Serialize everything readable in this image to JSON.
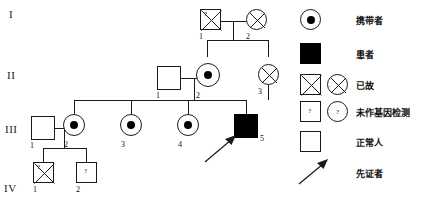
{
  "generations": [
    {
      "label": "I"
    },
    {
      "label": "II"
    },
    {
      "label": "III"
    },
    {
      "label": "IV"
    }
  ],
  "individuals": [
    {
      "id": "I-1",
      "number": "1",
      "sex": "male",
      "status": "untested-deceased",
      "generation": "I"
    },
    {
      "id": "I-2",
      "number": "2",
      "sex": "female",
      "status": "deceased",
      "generation": "I"
    },
    {
      "id": "II-1",
      "number": "1",
      "sex": "male",
      "status": "normal",
      "generation": "II"
    },
    {
      "id": "II-2",
      "number": "2",
      "sex": "female",
      "status": "carrier",
      "generation": "II"
    },
    {
      "id": "II-3",
      "number": "3",
      "sex": "female",
      "status": "deceased",
      "generation": "II"
    },
    {
      "id": "III-1",
      "number": "1",
      "sex": "male",
      "status": "normal",
      "generation": "III"
    },
    {
      "id": "III-2",
      "number": "2",
      "sex": "female",
      "status": "carrier",
      "generation": "III"
    },
    {
      "id": "III-3",
      "number": "3",
      "sex": "female",
      "status": "carrier",
      "generation": "III"
    },
    {
      "id": "III-4",
      "number": "4",
      "sex": "female",
      "status": "carrier",
      "generation": "III"
    },
    {
      "id": "III-5",
      "number": "5",
      "sex": "male",
      "status": "affected-proband",
      "generation": "III"
    },
    {
      "id": "IV-1",
      "number": "1",
      "sex": "male",
      "status": "untested-deceased",
      "generation": "IV"
    },
    {
      "id": "IV-2",
      "number": "2",
      "sex": "male",
      "status": "untested",
      "generation": "IV"
    }
  ],
  "question_mark": "?",
  "legend": {
    "items": [
      {
        "key": "carrier",
        "label": "携带者"
      },
      {
        "key": "affected",
        "label": "患者"
      },
      {
        "key": "deceased",
        "label": "已故"
      },
      {
        "key": "untested",
        "label": "未作基因检测"
      },
      {
        "key": "normal",
        "label": "正常人"
      },
      {
        "key": "proband",
        "label": "先证者"
      }
    ]
  },
  "colors": {
    "stroke": "#1a1a1a",
    "fill_affected": "#000000",
    "background": "#ffffff"
  }
}
